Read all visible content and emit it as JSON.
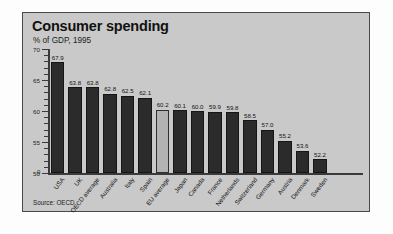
{
  "panel": {
    "title": "Consumer spending",
    "subtitle": "% of GDP, 1995",
    "source": "Source: OECD"
  },
  "chart_data": {
    "type": "bar",
    "title": "Consumer spending",
    "subtitle": "% of GDP, 1995",
    "xlabel": "",
    "ylabel": "",
    "ylim": [
      50,
      70
    ],
    "yticks": [
      50,
      55,
      60,
      65,
      70
    ],
    "axis_break_label": "0",
    "grid": false,
    "legend": null,
    "source": "Source: OECD",
    "highlight_color": "#b3b3b3",
    "bar_color": "#2b2b2b",
    "categories": [
      "USA",
      "UK",
      "OECD average",
      "Australia",
      "Italy",
      "Spain",
      "EU average",
      "Japan",
      "Canada",
      "France",
      "Netherlands",
      "Switzerland",
      "Germany",
      "Austria",
      "Denmark",
      "Sweden"
    ],
    "values": [
      67.9,
      63.8,
      63.8,
      62.8,
      62.5,
      62.1,
      60.2,
      60.1,
      60.0,
      59.9,
      59.8,
      58.5,
      57.0,
      55.2,
      53.6,
      52.2
    ],
    "highlighted": [
      "EU average"
    ],
    "bars": [
      {
        "label": "USA",
        "value": 67.9,
        "value_label": "67.9",
        "highlight": false
      },
      {
        "label": "UK",
        "value": 63.8,
        "value_label": "63.8",
        "highlight": false
      },
      {
        "label": "OECD average",
        "value": 63.8,
        "value_label": "63.8",
        "highlight": false
      },
      {
        "label": "Australia",
        "value": 62.8,
        "value_label": "62.8",
        "highlight": false
      },
      {
        "label": "Italy",
        "value": 62.5,
        "value_label": "62.5",
        "highlight": false
      },
      {
        "label": "Spain",
        "value": 62.1,
        "value_label": "62.1",
        "highlight": false
      },
      {
        "label": "EU average",
        "value": 60.2,
        "value_label": "60.2",
        "highlight": true
      },
      {
        "label": "Japan",
        "value": 60.1,
        "value_label": "60.1",
        "highlight": false
      },
      {
        "label": "Canada",
        "value": 60.0,
        "value_label": "60.0",
        "highlight": false
      },
      {
        "label": "France",
        "value": 59.9,
        "value_label": "59.9",
        "highlight": false
      },
      {
        "label": "Netherlands",
        "value": 59.8,
        "value_label": "59.8",
        "highlight": false
      },
      {
        "label": "Switzerland",
        "value": 58.5,
        "value_label": "58.5",
        "highlight": false
      },
      {
        "label": "Germany",
        "value": 57.0,
        "value_label": "57.0",
        "highlight": false
      },
      {
        "label": "Austria",
        "value": 55.2,
        "value_label": "55.2",
        "highlight": false
      },
      {
        "label": "Denmark",
        "value": 53.6,
        "value_label": "53.6",
        "highlight": false
      },
      {
        "label": "Sweden",
        "value": 52.2,
        "value_label": "52.2",
        "highlight": false
      }
    ]
  }
}
